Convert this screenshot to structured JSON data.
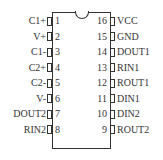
{
  "diagram": {
    "type": "ic-pinout",
    "package": "16-pin DIP",
    "left_pins": [
      {
        "number": "1",
        "label": "C1+"
      },
      {
        "number": "2",
        "label": "V+"
      },
      {
        "number": "3",
        "label": "C1-"
      },
      {
        "number": "4",
        "label": "C2+"
      },
      {
        "number": "5",
        "label": "C2-"
      },
      {
        "number": "6",
        "label": "V-"
      },
      {
        "number": "7",
        "label": "DOUT2"
      },
      {
        "number": "8",
        "label": "RIN2"
      }
    ],
    "right_pins": [
      {
        "number": "16",
        "label": "VCC"
      },
      {
        "number": "15",
        "label": "GND"
      },
      {
        "number": "14",
        "label": "DOUT1"
      },
      {
        "number": "13",
        "label": "RIN1"
      },
      {
        "number": "12",
        "label": "ROUT1"
      },
      {
        "number": "11",
        "label": "DIN1"
      },
      {
        "number": "10",
        "label": "DIN2"
      },
      {
        "number": "9",
        "label": "ROUT2"
      }
    ]
  }
}
